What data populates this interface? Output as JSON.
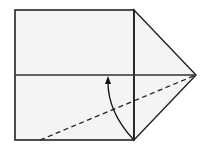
{
  "diagram": {
    "type": "origami-fold-step",
    "colors": {
      "background": "#ffffff",
      "paper": "#f4f4f4",
      "line": "#222222",
      "center_line": "#333333"
    },
    "square": {
      "x": 15,
      "y": 10,
      "width": 119,
      "height": 130
    },
    "triangle_flap": {
      "points": [
        [
          134,
          10
        ],
        [
          196,
          75
        ],
        [
          134,
          140
        ]
      ]
    },
    "center_crease": {
      "x1": 15,
      "y1": 75,
      "x2": 196,
      "y2": 75
    },
    "valley_fold_line": {
      "x1": 40,
      "y1": 140,
      "x2": 196,
      "y2": 75,
      "style": "dashed"
    },
    "fold_arrow": {
      "start": [
        133,
        139
      ],
      "control": [
        108,
        110
      ],
      "end": [
        108,
        79
      ],
      "direction": "up"
    }
  }
}
